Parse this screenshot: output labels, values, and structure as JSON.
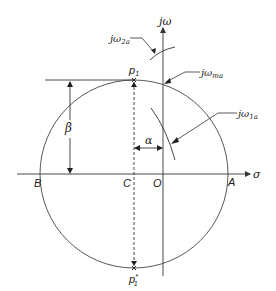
{
  "diagram": {
    "axes": {
      "horizontal_label": "σ",
      "vertical_label_j": "j",
      "vertical_label_omega": "ω"
    },
    "points": {
      "A": "A",
      "B": "B",
      "C": "C",
      "O": "O",
      "p1": "p",
      "p1_sub": "1",
      "p1_conj": "p",
      "p1_conj_sub": "1",
      "p1_conj_sup": "*"
    },
    "dimensions": {
      "alpha": "α",
      "beta": "β"
    },
    "callouts": {
      "jw2a": {
        "j": "j",
        "omega": "ω",
        "sub": "2a"
      },
      "jwma": {
        "j": "j",
        "omega": "ω",
        "sub": "ma"
      },
      "jw1a": {
        "j": "j",
        "omega": "ω",
        "sub": "1a"
      }
    },
    "colors": {
      "stroke": "#333333",
      "text": "#222222",
      "background": "#ffffff"
    }
  }
}
